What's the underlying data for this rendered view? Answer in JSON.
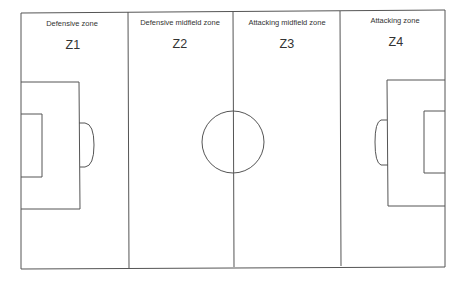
{
  "diagram": {
    "type": "football-pitch-zones",
    "line_color": "#555555",
    "background": "#ffffff",
    "zones": [
      {
        "id": "Z1",
        "code": "Z1",
        "title": "Defensive zone",
        "label_x": 72,
        "title_y": 19,
        "code_y": 38
      },
      {
        "id": "Z2",
        "code": "Z2",
        "title": "Defensive midfield zone",
        "label_x": 180,
        "title_y": 18,
        "code_y": 37
      },
      {
        "id": "Z3",
        "code": "Z3",
        "title": "Attacking midfield zone",
        "label_x": 287,
        "title_y": 18,
        "code_y": 37
      },
      {
        "id": "Z4",
        "code": "Z4",
        "title": "Attacking zone",
        "label_x": 395,
        "title_y": 16,
        "code_y": 35
      }
    ],
    "pitch": {
      "left": 21,
      "top": 12,
      "right": 445,
      "bottom": 268,
      "dividers_x": [
        128,
        233,
        340
      ],
      "center_circle": {
        "cx": 233,
        "cy": 142,
        "r": 31
      },
      "left_penalty_box": {
        "x1": 21,
        "y1": 82,
        "x2": 79,
        "y2": 209
      },
      "left_goal_box": {
        "x1": 21,
        "y1": 114,
        "x2": 42,
        "y2": 177
      },
      "left_arc": {
        "x": 79,
        "y1": 123,
        "y2": 167,
        "bulge_x": 94
      },
      "right_penalty_box": {
        "x1": 387,
        "y1": 80,
        "x2": 445,
        "y2": 206
      },
      "right_goal_box": {
        "x1": 424,
        "y1": 111,
        "x2": 445,
        "y2": 173
      },
      "right_arc": {
        "x": 387,
        "y1": 120,
        "y2": 165,
        "bulge_x": 375
      }
    }
  }
}
